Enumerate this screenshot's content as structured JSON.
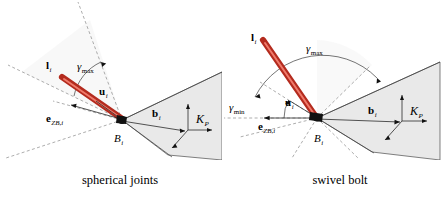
{
  "figure": {
    "background_color": "#ffffff",
    "rod_color": "#b42b1e",
    "rod_highlight_color": "#f07a6b",
    "platform_fill": "#e9e9e9",
    "line_color": "#3a3a3a",
    "dash_color": "#8a8a8a"
  },
  "panels": [
    {
      "id": "spherical-joints",
      "caption": "spherical joints",
      "labels": {
        "rod": "l",
        "rod_sub": "i",
        "unit_vector": "u",
        "unit_vector_sub": "i",
        "base_normal": "e",
        "base_normal_sub": "ZB,i",
        "base_point": "B",
        "base_point_sub": "i",
        "platform_vector": "b",
        "platform_vector_sub": "i",
        "frame": "K",
        "frame_sub": "P",
        "angle_max": "γ",
        "angle_max_sub": "max"
      }
    },
    {
      "id": "swivel-bolt",
      "caption": "swivel bolt",
      "labels": {
        "rod": "l",
        "rod_sub": "i",
        "unit_vector": "u",
        "unit_vector_sub": "i",
        "base_normal": "e",
        "base_normal_sub": "ZB,i",
        "base_point": "B",
        "base_point_sub": "i",
        "platform_vector": "b",
        "platform_vector_sub": "i",
        "frame": "K",
        "frame_sub": "P",
        "angle_max": "γ",
        "angle_max_sub": "max",
        "angle_min": "γ",
        "angle_min_sub": "min"
      }
    }
  ]
}
